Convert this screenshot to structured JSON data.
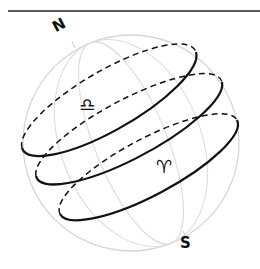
{
  "diagram": {
    "type": "celestial-sphere",
    "labels": {
      "north": "N",
      "south": "S"
    },
    "symbols": {
      "libra": "♎",
      "aries": "♈"
    },
    "colors": {
      "ink": "#111111",
      "sphere_outline": "#d4d4d4",
      "background": "#ffffff"
    },
    "circles": [
      {
        "id": "upper",
        "cx": 109,
        "cy": 100
      },
      {
        "id": "middle",
        "cx": 129,
        "cy": 129
      },
      {
        "id": "lower",
        "cx": 149,
        "cy": 167
      }
    ]
  }
}
